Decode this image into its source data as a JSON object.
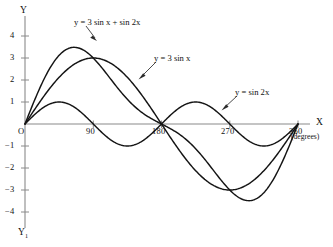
{
  "chart_data": {
    "type": "line",
    "title": "",
    "subtitle": "",
    "xlabel": "X",
    "xlabel_units": "(degrees)",
    "ylabel": "Y",
    "ylabel_bottom": "Y",
    "ylabel_bottom_sub": "1",
    "origin_label": "O",
    "xlim": [
      0,
      375
    ],
    "ylim": [
      -4.5,
      4.6
    ],
    "grid": false,
    "legend_position": "inline-annotations",
    "x_ticks": [
      90,
      180,
      270,
      360
    ],
    "x_tick_labels": [
      "90",
      "180",
      "270",
      "360"
    ],
    "y_ticks": [
      4,
      3,
      2,
      1,
      -1,
      -2,
      -3,
      -4
    ],
    "y_tick_labels": [
      "4",
      "3",
      "2",
      "1",
      "−1",
      "−2",
      "−3",
      "−4"
    ],
    "x": [
      0,
      10,
      20,
      30,
      40,
      50,
      60,
      70,
      80,
      90,
      100,
      110,
      120,
      130,
      140,
      150,
      160,
      170,
      180,
      190,
      200,
      210,
      220,
      230,
      240,
      250,
      260,
      270,
      280,
      290,
      300,
      310,
      320,
      330,
      340,
      350,
      360
    ],
    "series": [
      {
        "name": "y = 3 sin x + sin 2x",
        "label": "y = 3 sin x + sin 2x",
        "formula": "3*sin(x) + sin(2x)",
        "color": "#141414",
        "max_value": 3.46,
        "max_at_x": 70,
        "min_value": -3.46,
        "min_at_x": 290,
        "values": [
          0,
          0.862,
          1.669,
          2.366,
          2.913,
          3.283,
          3.464,
          3.461,
          3.297,
          3.0,
          2.614,
          2.178,
          1.732,
          1.314,
          0.956,
          0.683,
          0.512,
          0.455,
          0.0,
          -0.455,
          -0.512,
          -0.683,
          -0.956,
          -1.314,
          -1.732,
          -2.178,
          -2.614,
          -3.0,
          -3.297,
          -3.461,
          -3.464,
          -3.283,
          -2.913,
          -2.366,
          -1.669,
          -0.862,
          0
        ]
      },
      {
        "name": "y = 3 sin x",
        "label": "y = 3 sin x",
        "formula": "3*sin(x)",
        "color": "#141414",
        "max_value": 3.0,
        "max_at_x": 90,
        "min_value": -3.0,
        "min_at_x": 270,
        "values": [
          0,
          0.521,
          1.026,
          1.5,
          1.928,
          2.298,
          2.598,
          2.819,
          2.954,
          3.0,
          2.954,
          2.819,
          2.598,
          2.298,
          1.928,
          1.5,
          1.026,
          0.521,
          0,
          -0.521,
          -1.026,
          -1.5,
          -1.928,
          -2.298,
          -2.598,
          -2.819,
          -2.954,
          -3.0,
          -2.954,
          -2.819,
          -2.598,
          -2.298,
          -1.928,
          -1.5,
          -1.026,
          -0.521,
          0
        ]
      },
      {
        "name": "y = sin 2x",
        "label": "y = sin 2x",
        "formula": "sin(2x)",
        "color": "#141414",
        "max_value": 1.0,
        "max_at_x": 45,
        "min_value": -1.0,
        "min_at_x": 135,
        "values": [
          0,
          0.342,
          0.643,
          0.866,
          0.985,
          0.985,
          0.866,
          0.643,
          0.342,
          0,
          -0.342,
          -0.643,
          -0.866,
          -0.985,
          -0.985,
          -0.866,
          -0.643,
          -0.342,
          0,
          0.342,
          0.643,
          0.866,
          0.985,
          0.985,
          0.866,
          0.643,
          0.342,
          0,
          -0.342,
          -0.643,
          -0.866,
          -0.985,
          -0.985,
          -0.866,
          -0.643,
          -0.342,
          0
        ]
      }
    ],
    "annotations": [
      {
        "text": "y = 3 sin x + sin 2x",
        "points_to_series": "y = 3 sin x + sin 2x",
        "points_to_x": 88,
        "points_to_y": 3.3
      },
      {
        "text": "y = 3 sin x",
        "points_to_series": "y = 3 sin x",
        "points_to_x": 127,
        "points_to_y": 2.4
      },
      {
        "text": "y = sin 2x",
        "points_to_series": "y = sin 2x",
        "points_to_x": 243,
        "points_to_y": 0.92
      }
    ]
  }
}
